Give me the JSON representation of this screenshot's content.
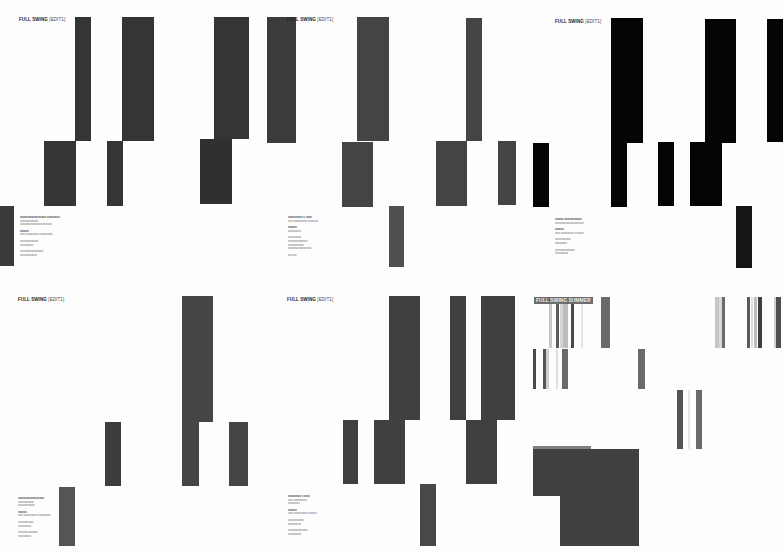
{
  "panels": [
    {
      "id": "p1",
      "title": "FULL SWING",
      "edit_label": "[EDIT1]",
      "bar_color": "#353535",
      "info": {
        "lines": [
          {
            "text": "xxxxxxxxxxxxxxxxxx xxxxxxxxx",
            "strong": true
          },
          {
            "text": "xxxxxxxxxxxxxx"
          },
          {
            "text": "xxxxxxxxxxxxxxxxx xxxxxxx"
          },
          {
            "gap": true
          },
          {
            "text": "xxxxxx",
            "strong": true
          },
          {
            "text": "xxxx xxxxxxxxxx xxxxxxxxxx"
          },
          {
            "gap": true
          },
          {
            "text": "xxxxxxxxxxxxxx"
          },
          {
            "text": "xxxxxxxxxx"
          },
          {
            "gap": true
          },
          {
            "text": "xxxxxxxxxxxxxxxxxx"
          },
          {
            "text": "xxxxxxxxxxxxx"
          }
        ]
      }
    },
    {
      "id": "p2",
      "title": "FULL SWING",
      "edit_label": "[EDIT1]",
      "bar_color": "#3c3c3c",
      "info": {
        "lines": [
          {
            "text": "xxxxxxxxxx x. xxxx",
            "strong": true
          },
          {
            "text": "xxxx xxxxxxxxxx xxxxxxxx"
          },
          {
            "gap": true
          },
          {
            "text": "xxxxxx",
            "strong": true
          },
          {
            "text": "xxxxxxxxxx"
          },
          {
            "gap": true
          },
          {
            "text": "xxxxxxxxxx"
          },
          {
            "text": "xxxxxxxxxxxxxxx"
          },
          {
            "text": "xxxxxxxxxxxx"
          },
          {
            "text": "xxxxxxxxxxxxxxxxxx"
          },
          {
            "gap": true
          },
          {
            "text": "xxx xxx"
          }
        ]
      }
    },
    {
      "id": "p3",
      "title": "FULL SWING",
      "edit_label": "[EDIT1]",
      "bar_color": "#060606",
      "info": {
        "lines": [
          {
            "text": "xxxxxx xxxxxxxxxxxx",
            "strong": true
          },
          {
            "text": "xxxxxxxxxxxxxxxxxxxxxx"
          },
          {
            "gap": true
          },
          {
            "text": "xxxxxx",
            "strong": true
          },
          {
            "text": "xxxx xxxxxxxxxx xxxxxxx"
          },
          {
            "gap": true
          },
          {
            "text": "xxxxxxxxxxxx"
          },
          {
            "text": "xxxxxxxxx"
          },
          {
            "gap": true
          },
          {
            "text": "xxxxxxxxxxxxxxx"
          },
          {
            "text": "xxxxxxxxxx"
          }
        ]
      }
    },
    {
      "id": "p4",
      "title": "FULL SWING",
      "edit_label": "[EDIT1]",
      "bar_color": "#454545",
      "info": {
        "lines": [
          {
            "text": "xxxxxxxxxxxxxxxxxx",
            "strong": true
          },
          {
            "text": "xxxxxxxxxxxx"
          },
          {
            "text": "xxxxxxxxxxxxx"
          },
          {
            "gap": true
          },
          {
            "text": "xxxxxx",
            "strong": true
          },
          {
            "text": "xxxx xxxxxxxxxx xxxxxxxxxx"
          },
          {
            "gap": true
          },
          {
            "text": "xxxxxxxxxxxx"
          },
          {
            "text": "xxxxxxxxxx"
          },
          {
            "gap": true
          },
          {
            "text": "xxxxxxxxxxxxxxx"
          },
          {
            "text": "xxxxxxxxxx"
          }
        ]
      }
    },
    {
      "id": "p5",
      "title": "FULL SWING",
      "edit_label": "[EDIT1]",
      "bar_color": "#404040",
      "info": {
        "lines": [
          {
            "text": "xxxxxxxxx x xxxx",
            "strong": true
          },
          {
            "text": "xxxx xxxxxxxxxx"
          },
          {
            "text": "xxxxxxxxx"
          },
          {
            "gap": true
          },
          {
            "text": "xxxxxx",
            "strong": true
          },
          {
            "text": "xxxx xxxxxxxxxx xxxxxxx"
          },
          {
            "gap": true
          },
          {
            "text": "xxxxxxxxxxxx"
          },
          {
            "text": "xxxxxxxxxx"
          },
          {
            "gap": true
          },
          {
            "text": "xxxxxxxxxxxxxxx"
          },
          {
            "text": "xxxxxxxxxx"
          }
        ]
      }
    },
    {
      "id": "p6",
      "title": "FULL SWING SUMMER"
    }
  ]
}
